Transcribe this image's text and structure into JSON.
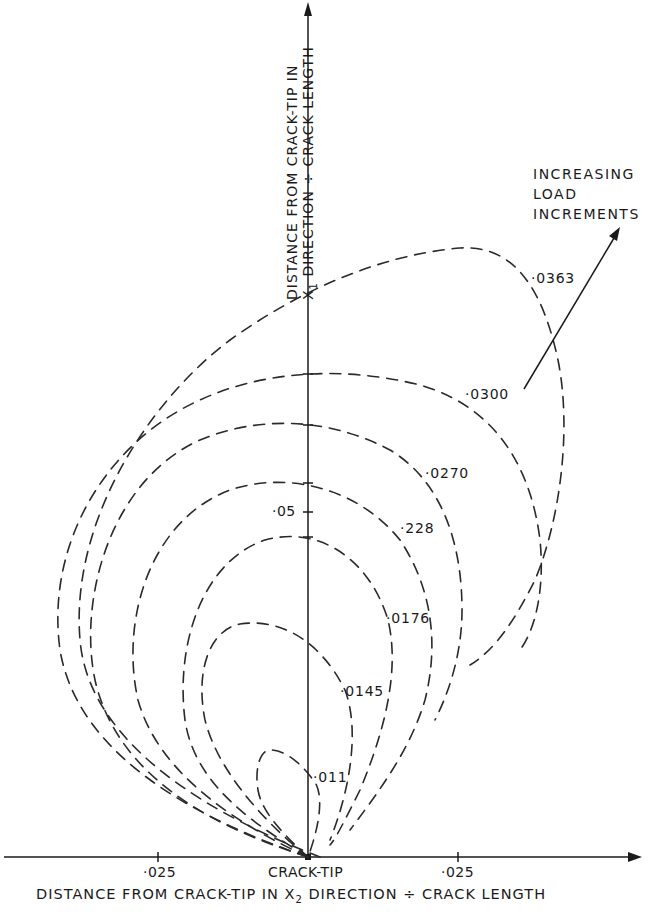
{
  "diagram": {
    "title": "",
    "x_axis": {
      "label": "DISTANCE FROM CRACK-TIP IN X2 DIRECTION ÷ CRACK LENGTH",
      "label_parts": {
        "pre": "DISTANCE FROM CRACK-TIP IN X",
        "sub": "2",
        "post": " DIRECTION ÷ CRACK LENGTH"
      },
      "origin_label": "CRACK-TIP",
      "ticks": [
        {
          "value": "·025",
          "side": "left"
        },
        {
          "value": "·025",
          "side": "right"
        }
      ]
    },
    "y_axis": {
      "label_line1": "DISTANCE FROM CRACK-TIP IN",
      "label_line2_pre": "X",
      "label_line2_sub": "1",
      "label_line2_post": " DIRECTION ÷ CRACK LENGTH",
      "ticks": [
        {
          "value": "·05"
        }
      ]
    },
    "annotation": {
      "lines": [
        "INCREASING",
        "LOAD",
        "INCREMENTS"
      ],
      "arrow": "pointing outward across contours"
    },
    "contours": [
      {
        "label": "·011"
      },
      {
        "label": "·0145"
      },
      {
        "label": "·0176"
      },
      {
        "label": "·228"
      },
      {
        "label": "·0270"
      },
      {
        "label": "·0300"
      },
      {
        "label": "·0363"
      }
    ],
    "colors": {
      "ink": "#1a1a1a",
      "background": "#ffffff"
    }
  }
}
